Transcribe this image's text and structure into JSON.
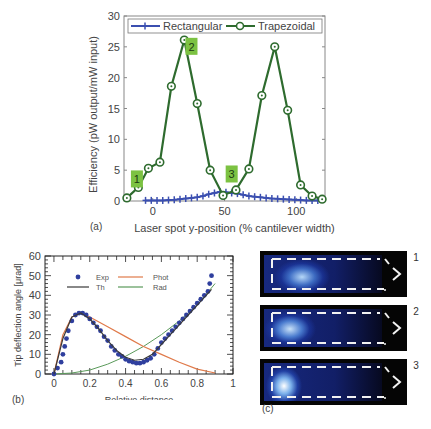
{
  "panels": {
    "a": {
      "label": "(a)"
    },
    "b": {
      "label": "(b)"
    },
    "c": {
      "label": "(c)"
    }
  },
  "chart_data": [
    {
      "id": "a",
      "type": "line",
      "title": "",
      "xlabel": "Laser spot y-position (% cantilever width)",
      "ylabel": "Efficiency (pW output/mW input)",
      "xlim": [
        -20,
        120
      ],
      "ylim": [
        0,
        30
      ],
      "xticks": [
        0,
        50,
        100
      ],
      "yticks": [
        0,
        5,
        10,
        15,
        20,
        25,
        30
      ],
      "grid": false,
      "legend_position": "top",
      "series": [
        {
          "name": "Rectangular",
          "color": "#3b4fb0",
          "marker": "+",
          "x": [
            -5,
            -1,
            3,
            7,
            11,
            15,
            19,
            23,
            27,
            31,
            35,
            39,
            43,
            47,
            51,
            55,
            59,
            63,
            67,
            71,
            75,
            79,
            83,
            87,
            91,
            95,
            99,
            103,
            107,
            111,
            115
          ],
          "y": [
            0.1,
            0.1,
            0.1,
            0.1,
            0.15,
            0.2,
            0.3,
            0.4,
            0.5,
            0.6,
            0.8,
            1.1,
            1.3,
            1.5,
            1.4,
            1.3,
            1.2,
            1.0,
            0.8,
            0.7,
            0.6,
            0.5,
            0.4,
            0.35,
            0.3,
            0.25,
            0.2,
            0.15,
            0.1,
            0.1,
            0.1
          ]
        },
        {
          "name": "Trapezoidal",
          "color": "#2e6b2e",
          "marker": "o",
          "x": [
            -18,
            -10,
            -3,
            5,
            13,
            22,
            31,
            40,
            49,
            58,
            67,
            76,
            85,
            94,
            103,
            111,
            118
          ],
          "y": [
            0.5,
            2.2,
            5.3,
            6.3,
            18.6,
            26.1,
            15.8,
            5.0,
            0.9,
            1.8,
            5.2,
            17.1,
            25.0,
            14.7,
            2.6,
            0.8,
            0.3
          ]
        }
      ],
      "annotations": [
        {
          "text": "1",
          "x": -11,
          "y": 3.5
        },
        {
          "text": "2",
          "x": 27,
          "y": 25
        },
        {
          "text": "3",
          "x": 55,
          "y": 4.3
        }
      ]
    },
    {
      "id": "b",
      "type": "line",
      "title": "",
      "xlabel": "Relative distance",
      "ylabel": "Tip deflection angle [μrad]",
      "xlim": [
        -0.05,
        1.0
      ],
      "ylim": [
        0,
        60
      ],
      "xticks": [
        0,
        0.2,
        0.4,
        0.6,
        0.8,
        1
      ],
      "yticks": [
        0,
        10,
        20,
        30,
        40,
        50,
        60
      ],
      "grid": false,
      "legend_position": "top",
      "series": [
        {
          "name": "Exp",
          "type": "scatter",
          "color": "#2f3f9e",
          "x": [
            0.0,
            0.02,
            0.04,
            0.05,
            0.06,
            0.07,
            0.08,
            0.1,
            0.12,
            0.14,
            0.16,
            0.18,
            0.2,
            0.22,
            0.24,
            0.26,
            0.28,
            0.3,
            0.32,
            0.34,
            0.36,
            0.38,
            0.4,
            0.42,
            0.44,
            0.46,
            0.48,
            0.5,
            0.52,
            0.54,
            0.56,
            0.58,
            0.6,
            0.62,
            0.64,
            0.66,
            0.68,
            0.7,
            0.72,
            0.74,
            0.76,
            0.78,
            0.8,
            0.82,
            0.84,
            0.86,
            0.87,
            0.88
          ],
          "y": [
            0,
            3,
            6,
            10,
            14,
            18,
            22,
            27,
            30,
            31,
            31,
            30,
            28,
            26,
            24,
            22,
            19,
            17,
            14,
            12,
            10,
            9,
            7.5,
            6.5,
            6,
            5.5,
            5.5,
            6,
            7,
            8,
            10,
            13,
            16,
            18,
            20,
            22,
            24,
            26,
            28,
            30,
            32,
            34,
            36,
            38,
            40,
            42,
            46,
            50
          ]
        },
        {
          "name": "Th",
          "color": "#3a3a3a",
          "x": [
            0.0,
            0.05,
            0.1,
            0.15,
            0.2,
            0.25,
            0.3,
            0.35,
            0.4,
            0.45,
            0.5,
            0.55,
            0.6,
            0.65,
            0.7,
            0.75,
            0.8,
            0.85,
            0.88
          ],
          "y": [
            0,
            18,
            29,
            31,
            28,
            23,
            17,
            12,
            8.5,
            7,
            7.5,
            10,
            15,
            20,
            25,
            30,
            35,
            40,
            43
          ]
        },
        {
          "name": "Phot",
          "color": "#e07a4a",
          "x": [
            0.0,
            0.05,
            0.1,
            0.15,
            0.2,
            0.3,
            0.4,
            0.5,
            0.6,
            0.7,
            0.8,
            0.9
          ],
          "y": [
            0,
            20,
            29,
            31,
            29,
            24,
            19,
            14,
            10,
            6,
            2.5,
            0.5
          ]
        },
        {
          "name": "Rad",
          "color": "#5a9a5a",
          "x": [
            0.0,
            0.1,
            0.2,
            0.3,
            0.4,
            0.5,
            0.6,
            0.7,
            0.8,
            0.9
          ],
          "y": [
            0,
            0.5,
            2,
            5,
            9,
            14,
            20,
            27,
            35,
            46
          ]
        }
      ]
    }
  ],
  "panel_c": {
    "images": [
      {
        "number": "1",
        "glow_position": "left-mid"
      },
      {
        "number": "2",
        "glow_position": "left"
      },
      {
        "number": "3",
        "glow_position": "far-left"
      }
    ]
  }
}
